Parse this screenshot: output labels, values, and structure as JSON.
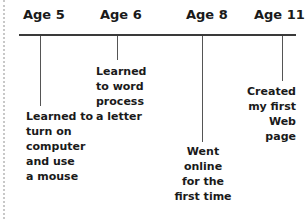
{
  "timeline": {
    "events": [
      {
        "age": "Age 5",
        "text": [
          "Learned to",
          "turn on",
          "computer",
          "and use",
          "a mouse"
        ]
      },
      {
        "age": "Age 6",
        "text": [
          "Learned",
          "to word",
          "process",
          "a letter"
        ]
      },
      {
        "age": "Age 8",
        "text": [
          "Went online",
          "for the",
          "first time"
        ]
      },
      {
        "age": "Age 11",
        "text": [
          "Created",
          "my first",
          "Web page"
        ]
      }
    ]
  }
}
